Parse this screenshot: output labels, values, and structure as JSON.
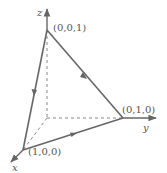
{
  "diagram": {
    "type": "3d-coordinate-triangle",
    "colors": {
      "edge": "#666666",
      "dashed": "#888888",
      "text": "#555555"
    },
    "axes": {
      "x_label": "x",
      "y_label": "y",
      "z_label": "z"
    },
    "vertices": [
      {
        "id": "z-vertex",
        "label": "(0,0,1)"
      },
      {
        "id": "y-vertex",
        "label": "(0,1,0)"
      },
      {
        "id": "x-vertex",
        "label": "(1,0,0)"
      }
    ],
    "edges": [
      {
        "from": "(1,0,0)",
        "to": "(0,1,0)",
        "direction_arrow": true
      },
      {
        "from": "(0,1,0)",
        "to": "(0,0,1)",
        "direction_arrow": true
      },
      {
        "from": "(0,0,1)",
        "to": "(1,0,0)",
        "direction_arrow": true
      }
    ]
  }
}
